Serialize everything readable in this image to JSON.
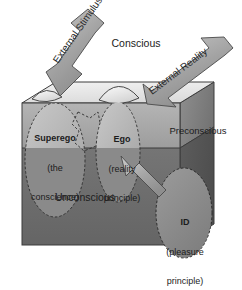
{
  "diagram": {
    "background_color": "#ffffff",
    "regions": {
      "conscious": {
        "label": "Conscious",
        "color": "#e9e9e9"
      },
      "preconscious": {
        "label": "Preconscious",
        "color": "#a9a9a9"
      },
      "unconscious": {
        "label": "Unconscious",
        "color": "#6d6d6d"
      }
    },
    "structures": {
      "superego": {
        "name": "Superego",
        "line2": "(the",
        "line3": "conscience)",
        "color": "#b9b9b9"
      },
      "ego": {
        "name": "Ego",
        "line2": "(reality",
        "line3": "principle)",
        "color": "#b9b9b9"
      },
      "id": {
        "name": "ID",
        "line2": "(pleasure",
        "line3": "principle)",
        "color": "#8d8d8d"
      }
    },
    "arrows": [
      {
        "name": "external-stimulus",
        "label": "External Stimulus",
        "direction": "down-left",
        "target": "superego",
        "color": "#9a9a9a"
      },
      {
        "name": "external-reality",
        "label": "External Reality",
        "direction": "down-left",
        "target": "ego",
        "color": "#9a9a9a"
      },
      {
        "name": "id-to-ego",
        "label": "",
        "direction": "up-left",
        "target": "ego",
        "color": "#9a9a9a"
      }
    ]
  }
}
